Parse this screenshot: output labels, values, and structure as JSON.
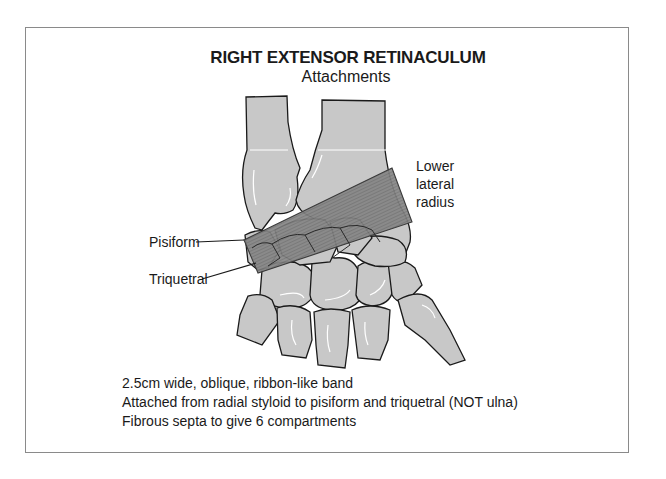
{
  "figure": {
    "title": "RIGHT EXTENSOR RETINACULUM",
    "subtitle": "Attachments",
    "labels": {
      "lower_lateral_radius": [
        "Lower",
        "lateral",
        "radius"
      ],
      "pisiform": "Pisiform",
      "triquetral": "Triquetral"
    },
    "notes": [
      "2.5cm wide, oblique, ribbon-like band",
      "Attached from radial styloid to pisiform and triquetral (NOT ulna)",
      "Fibrous septa to give 6 compartments"
    ],
    "colors": {
      "bone_fill": "#c8c8c8",
      "bone_outline": "#1a1a1a",
      "retinaculum_fill": "#7a7a7a",
      "frame_border": "#8a8a8a",
      "text": "#1a1a1a"
    }
  }
}
